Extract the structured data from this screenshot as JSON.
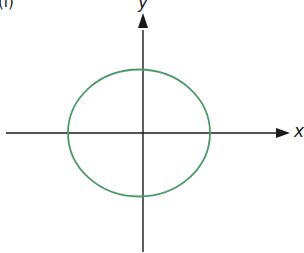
{
  "panel_label": "(i)",
  "axes": {
    "x_label": "x",
    "y_label": "y"
  },
  "shape": {
    "type": "ellipse",
    "color": "#4a9a6a",
    "center": [
      0,
      0
    ]
  },
  "colors": {
    "axis": "#1a1a1a",
    "curve": "#4a9a6a"
  }
}
